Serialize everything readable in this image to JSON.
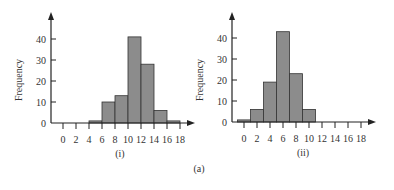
{
  "figure_label": "(a)",
  "chart_data": [
    {
      "type": "bar",
      "title": "(i)",
      "xlabel": "",
      "ylabel": "Frequency",
      "ylim": [
        0,
        40
      ],
      "yticks": [
        0,
        10,
        20,
        30,
        40
      ],
      "xticks": [
        0,
        2,
        4,
        6,
        8,
        10,
        12,
        14,
        16,
        18
      ],
      "bins": [
        [
          4,
          6
        ],
        [
          6,
          8
        ],
        [
          8,
          10
        ],
        [
          10,
          12
        ],
        [
          12,
          14
        ],
        [
          14,
          16
        ],
        [
          16,
          18
        ]
      ],
      "categories": [
        "4-6",
        "6-8",
        "8-10",
        "10-12",
        "12-14",
        "14-16",
        "16-18"
      ],
      "values": [
        1,
        10,
        13,
        41,
        28,
        6,
        1
      ],
      "grid": false,
      "legend": null
    },
    {
      "type": "bar",
      "title": "(ii)",
      "xlabel": "",
      "ylabel": "Frequency",
      "ylim": [
        0,
        40
      ],
      "yticks": [
        0,
        10,
        20,
        30,
        40
      ],
      "xticks": [
        0,
        2,
        4,
        6,
        8,
        10,
        12,
        14,
        16,
        18
      ],
      "bins": [
        [
          -1,
          1
        ],
        [
          1,
          3
        ],
        [
          3,
          5
        ],
        [
          5,
          7
        ],
        [
          7,
          9
        ],
        [
          9,
          11
        ]
      ],
      "categories": [
        "0",
        "2",
        "4",
        "6",
        "8",
        "10"
      ],
      "values": [
        1,
        6,
        19,
        43,
        23,
        6
      ],
      "grid": false,
      "legend": null
    }
  ]
}
